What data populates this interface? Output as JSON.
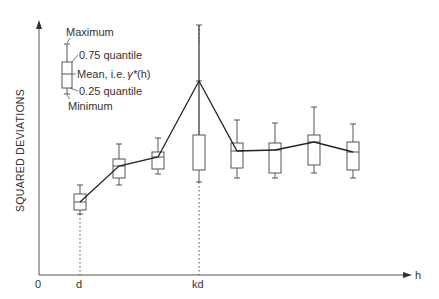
{
  "chart_data": {
    "type": "boxplot",
    "title": "",
    "xlabel": "h",
    "ylabel": "SQUARED DEVIATIONS",
    "x_ticks": [
      "0",
      "d",
      "kd"
    ],
    "grid": false,
    "legend": {
      "position": "top-left",
      "entries": [
        "Maximum",
        "0.75 quantile",
        "Mean, i.e. γ*(h)",
        "0.25 quantile",
        "Minimum"
      ]
    },
    "series": [
      {
        "name": "boxes",
        "lags": [
          "d",
          "2d",
          "3d",
          "kd",
          "5d",
          "6d",
          "7d",
          "8d"
        ],
        "max": [
          185,
          144,
          138,
          25,
          120,
          123,
          107,
          124
        ],
        "q75": [
          194,
          159,
          152,
          135,
          143,
          143,
          135,
          142
        ],
        "mean": [
          202,
          166,
          157,
          81,
          151,
          150,
          142,
          152
        ],
        "q25": [
          210,
          178,
          169,
          170,
          168,
          173,
          165,
          170
        ],
        "min": [
          214,
          185,
          174,
          182,
          178,
          178,
          173,
          178
        ]
      }
    ]
  },
  "axes": {
    "x_label": "h",
    "y_label": "SQUARED DEVIATIONS",
    "origin_label": "0",
    "tick_d": "d",
    "tick_kd": "kd"
  },
  "legend": {
    "maximum": "Maximum",
    "q75": "0.75 quantile",
    "mean": "Mean, i.e.",
    "mean_symbol": "γ*",
    "mean_arg": "(h)",
    "q25": "0.25 quantile",
    "minimum": "Minimum"
  },
  "colors": {
    "line": "#333333",
    "box": "#555555",
    "axis": "#555555"
  }
}
